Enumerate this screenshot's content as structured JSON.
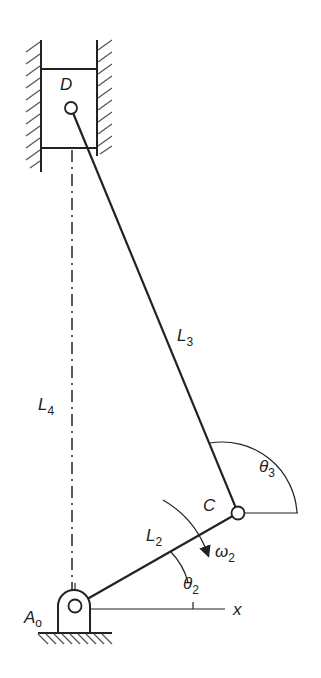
{
  "diagram": {
    "type": "slider-crank mechanism (vertical)",
    "colors": {
      "line": "#222222",
      "hatch": "#555555",
      "background": "#ffffff"
    },
    "labels": {
      "piston_pin": "D",
      "ground_pivot": {
        "main": "A",
        "sub": "o"
      },
      "crank_pin": "C",
      "coupler_length": {
        "main": "L",
        "sub": "3"
      },
      "offset_length": {
        "main": "L",
        "sub": "4"
      },
      "crank_length": {
        "main": "L",
        "sub": "2"
      },
      "coupler_angle": {
        "main": "θ",
        "sub": "3"
      },
      "crank_angle": {
        "main": "θ",
        "sub": "2"
      },
      "angular_velocity": {
        "main": "ω",
        "sub": "2"
      },
      "x_axis": "x"
    }
  }
}
